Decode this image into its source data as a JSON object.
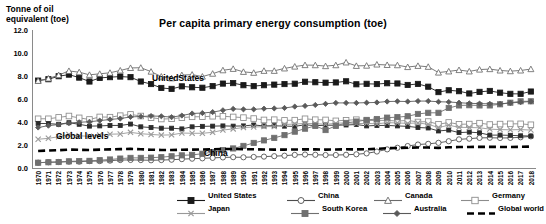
{
  "axis_title": "Tonne of oil\nequivalent (toe)",
  "title": "Per capita primary energy consumption (toe)",
  "annotations": {
    "united_states": "UnitedStates",
    "global_levels": "Global levels",
    "china": "China"
  },
  "legend": {
    "items": [
      {
        "label": "United States",
        "marker": "square-filled",
        "color": "#1a1a1a",
        "dash": "solid"
      },
      {
        "label": "China",
        "marker": "circle-open",
        "color": "#4d4d4d",
        "dash": "solid"
      },
      {
        "label": "Canada",
        "marker": "triangle-open",
        "color": "#6b6b6b",
        "dash": "solid"
      },
      {
        "label": "Germany",
        "marker": "square-open",
        "color": "#8c8c8c",
        "dash": "solid"
      },
      {
        "label": "United Kingdom",
        "marker": "square-small",
        "color": "#2b2b2b",
        "dash": "solid"
      },
      {
        "label": "Japan",
        "marker": "x-mark",
        "color": "#999999",
        "dash": "solid"
      },
      {
        "label": "South Korea",
        "marker": "square-filled",
        "color": "#707070",
        "dash": "solid"
      },
      {
        "label": "Australia",
        "marker": "diamond-filled",
        "color": "#5a5a5a",
        "dash": "solid"
      },
      {
        "label": "Global world",
        "marker": "none",
        "color": "#000000",
        "dash": "dashed"
      }
    ]
  },
  "chart_data": {
    "type": "line",
    "title": "Per capita primary energy consumption (toe)",
    "xlabel": "",
    "ylabel": "Tonne of oil equivalent (toe)",
    "ylim": [
      0.0,
      12.0
    ],
    "yticks": [
      "0.0",
      "2.0",
      "4.0",
      "6.0",
      "8.0",
      "10.0",
      "12.0"
    ],
    "ytick_values": [
      0.0,
      2.0,
      4.0,
      6.0,
      8.0,
      10.0,
      12.0
    ],
    "grid": false,
    "legend_position": "bottom",
    "x": [
      1970,
      1971,
      1972,
      1973,
      1974,
      1975,
      1976,
      1977,
      1978,
      1979,
      1980,
      1981,
      1982,
      1983,
      1984,
      1985,
      1986,
      1987,
      1988,
      1989,
      1990,
      1991,
      1992,
      1993,
      1994,
      1995,
      1996,
      1997,
      1998,
      1999,
      2000,
      2001,
      2002,
      2003,
      2004,
      2005,
      2006,
      2007,
      2008,
      2009,
      2010,
      2011,
      2012,
      2013,
      2014,
      2015,
      2016,
      2017,
      2018
    ],
    "series": [
      {
        "name": "United States",
        "values": [
          7.6,
          7.72,
          7.98,
          8.12,
          7.86,
          7.52,
          7.83,
          7.9,
          7.95,
          7.9,
          7.52,
          7.3,
          6.96,
          6.88,
          7.1,
          7.02,
          6.98,
          7.12,
          7.34,
          7.38,
          7.2,
          7.12,
          7.2,
          7.25,
          7.3,
          7.33,
          7.5,
          7.46,
          7.42,
          7.44,
          7.54,
          7.28,
          7.32,
          7.3,
          7.37,
          7.35,
          7.22,
          7.31,
          7.07,
          6.6,
          6.76,
          6.68,
          6.48,
          6.62,
          6.7,
          6.55,
          6.45,
          6.45,
          6.65
        ]
      },
      {
        "name": "China",
        "values": [
          0.46,
          0.5,
          0.52,
          0.55,
          0.55,
          0.6,
          0.6,
          0.64,
          0.69,
          0.7,
          0.69,
          0.67,
          0.69,
          0.72,
          0.77,
          0.81,
          0.84,
          0.88,
          0.92,
          0.94,
          0.93,
          0.96,
          0.99,
          1.03,
          1.07,
          1.14,
          1.17,
          1.15,
          1.13,
          1.13,
          1.15,
          1.19,
          1.27,
          1.43,
          1.62,
          1.76,
          1.91,
          2.04,
          2.1,
          2.19,
          2.33,
          2.49,
          2.55,
          2.62,
          2.63,
          2.61,
          2.62,
          2.67,
          2.75
        ]
      },
      {
        "name": "Canada",
        "values": [
          7.58,
          7.78,
          8.08,
          8.44,
          8.33,
          8.1,
          8.19,
          8.28,
          8.48,
          8.7,
          8.72,
          8.38,
          7.95,
          7.8,
          8.08,
          8.12,
          7.95,
          8.2,
          8.5,
          8.62,
          8.36,
          8.28,
          8.45,
          8.45,
          8.66,
          8.82,
          8.95,
          8.94,
          8.86,
          8.94,
          9.18,
          8.88,
          8.9,
          9.0,
          8.96,
          8.94,
          8.78,
          8.88,
          8.8,
          8.3,
          8.4,
          8.52,
          8.4,
          8.56,
          8.6,
          8.48,
          8.42,
          8.48,
          8.6
        ]
      },
      {
        "name": "Germany",
        "values": [
          4.28,
          4.28,
          4.4,
          4.52,
          4.36,
          4.22,
          4.44,
          4.42,
          4.55,
          4.66,
          4.52,
          4.38,
          4.26,
          4.28,
          4.38,
          4.45,
          4.46,
          4.5,
          4.5,
          4.44,
          4.38,
          4.3,
          4.18,
          4.2,
          4.14,
          4.16,
          4.28,
          4.2,
          4.18,
          4.1,
          4.15,
          4.2,
          4.12,
          4.14,
          4.14,
          4.08,
          4.14,
          4.0,
          4.04,
          3.8,
          3.96,
          3.8,
          3.82,
          3.9,
          3.78,
          3.82,
          3.84,
          3.84,
          3.76
        ]
      },
      {
        "name": "United Kingdom",
        "values": [
          3.88,
          3.86,
          3.8,
          3.94,
          3.8,
          3.64,
          3.66,
          3.7,
          3.7,
          3.82,
          3.58,
          3.52,
          3.46,
          3.46,
          3.4,
          3.58,
          3.62,
          3.64,
          3.66,
          3.64,
          3.66,
          3.74,
          3.66,
          3.68,
          3.64,
          3.62,
          3.76,
          3.68,
          3.72,
          3.72,
          3.74,
          3.78,
          3.66,
          3.7,
          3.7,
          3.66,
          3.62,
          3.52,
          3.48,
          3.22,
          3.3,
          3.08,
          3.12,
          3.06,
          2.86,
          2.86,
          2.84,
          2.8,
          2.78
        ]
      },
      {
        "name": "Japan",
        "values": [
          2.5,
          2.58,
          2.72,
          2.92,
          2.8,
          2.76,
          2.86,
          2.94,
          2.96,
          3.1,
          2.98,
          2.92,
          2.86,
          2.88,
          3.04,
          3.02,
          3.02,
          3.1,
          3.3,
          3.4,
          3.52,
          3.56,
          3.6,
          3.6,
          3.78,
          3.82,
          3.88,
          3.86,
          3.8,
          3.88,
          3.94,
          3.86,
          3.88,
          3.84,
          3.94,
          3.92,
          3.88,
          3.92,
          3.8,
          3.52,
          3.72,
          3.54,
          3.52,
          3.5,
          3.38,
          3.34,
          3.32,
          3.34,
          3.3
        ]
      },
      {
        "name": "South Korea",
        "values": [
          0.46,
          0.5,
          0.52,
          0.58,
          0.6,
          0.62,
          0.68,
          0.74,
          0.82,
          0.88,
          0.88,
          0.9,
          0.94,
          1.02,
          1.1,
          1.14,
          1.24,
          1.38,
          1.56,
          1.7,
          1.92,
          2.18,
          2.4,
          2.62,
          2.86,
          3.16,
          3.42,
          3.66,
          3.3,
          3.66,
          3.92,
          4.04,
          4.18,
          4.26,
          4.38,
          4.42,
          4.5,
          4.7,
          4.8,
          4.8,
          5.22,
          5.44,
          5.46,
          5.44,
          5.44,
          5.54,
          5.68,
          5.8,
          5.8
        ]
      },
      {
        "name": "Australia",
        "values": [
          3.52,
          3.68,
          3.78,
          3.9,
          3.98,
          4.02,
          4.12,
          4.22,
          4.3,
          4.44,
          4.48,
          4.52,
          4.5,
          4.42,
          4.56,
          4.74,
          4.78,
          4.86,
          5.02,
          5.14,
          5.1,
          5.1,
          5.16,
          5.18,
          5.22,
          5.34,
          5.4,
          5.48,
          5.58,
          5.66,
          5.66,
          5.66,
          5.68,
          5.7,
          5.78,
          5.8,
          5.78,
          5.82,
          5.82,
          5.76,
          5.74,
          5.68,
          5.62,
          5.6,
          5.58,
          5.58,
          5.66,
          5.72,
          5.78
        ]
      },
      {
        "name": "Global world",
        "values": [
          1.48,
          1.52,
          1.55,
          1.6,
          1.58,
          1.56,
          1.6,
          1.62,
          1.64,
          1.66,
          1.63,
          1.59,
          1.57,
          1.56,
          1.59,
          1.6,
          1.61,
          1.63,
          1.65,
          1.65,
          1.64,
          1.63,
          1.61,
          1.6,
          1.6,
          1.61,
          1.62,
          1.62,
          1.6,
          1.61,
          1.63,
          1.62,
          1.63,
          1.67,
          1.72,
          1.74,
          1.76,
          1.78,
          1.78,
          1.75,
          1.8,
          1.82,
          1.83,
          1.84,
          1.84,
          1.83,
          1.83,
          1.84,
          1.86
        ]
      }
    ]
  }
}
